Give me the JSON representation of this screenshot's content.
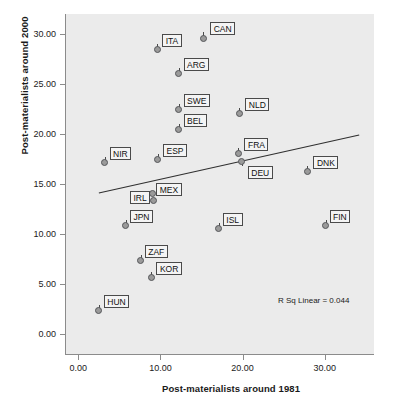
{
  "chart_data": {
    "type": "scatter",
    "title": "",
    "xlabel": "Post-materialists around 1981",
    "ylabel": "Post-materialists around 2000",
    "xlim": [
      -1.5,
      36.0
    ],
    "ylim": [
      -2.0,
      32.0
    ],
    "xticks": [
      "0.00",
      "10.00",
      "20.00",
      "30.00"
    ],
    "xtick_values": [
      0,
      10,
      20,
      30
    ],
    "yticks": [
      "0.00",
      "5.00",
      "10.00",
      "15.00",
      "20.00",
      "25.00",
      "30.00"
    ],
    "ytick_values": [
      0,
      5,
      10,
      15,
      20,
      25,
      30
    ],
    "grid": false,
    "legend": "none",
    "annotation": "R Sq Linear = 0.044",
    "fit_line": {
      "x_start": 2.5,
      "y_start": 14.1,
      "x_end": 34.2,
      "y_end": 19.9
    },
    "point_label_key": "label",
    "points": [
      {
        "label": "CAN",
        "x": 15.2,
        "y": 29.6,
        "lx": 7,
        "ly": -16
      },
      {
        "label": "ITA",
        "x": 9.6,
        "y": 28.5,
        "lx": 5,
        "ly": -15
      },
      {
        "label": "ARG",
        "x": 12.2,
        "y": 26.1,
        "lx": 5,
        "ly": -15
      },
      {
        "label": "SWE",
        "x": 12.2,
        "y": 22.5,
        "lx": 5,
        "ly": -15
      },
      {
        "label": "NLD",
        "x": 19.6,
        "y": 22.1,
        "lx": 6,
        "ly": -15
      },
      {
        "label": "BEL",
        "x": 12.2,
        "y": 20.5,
        "lx": 5,
        "ly": -15
      },
      {
        "label": "FRA",
        "x": 19.5,
        "y": 18.1,
        "lx": 6,
        "ly": -15
      },
      {
        "label": "ESP",
        "x": 9.7,
        "y": 17.5,
        "lx": 5,
        "ly": -15
      },
      {
        "label": "NIR",
        "x": 3.2,
        "y": 17.2,
        "lx": 5,
        "ly": -15
      },
      {
        "label": "DEU",
        "x": 19.9,
        "y": 17.3,
        "lx": 6,
        "ly": 5
      },
      {
        "label": "DNK",
        "x": 27.9,
        "y": 16.3,
        "lx": 6,
        "ly": -15
      },
      {
        "label": "MEX",
        "x": 9.0,
        "y": 14.1,
        "lx": 4,
        "ly": -10
      },
      {
        "label": "IRL",
        "x": 9.2,
        "y": 13.4,
        "lx": -24,
        "ly": -9
      },
      {
        "label": "JPN",
        "x": 5.8,
        "y": 10.9,
        "lx": 4,
        "ly": -15
      },
      {
        "label": "ISL",
        "x": 17.1,
        "y": 10.6,
        "lx": 4,
        "ly": -15
      },
      {
        "label": "FIN",
        "x": 30.1,
        "y": 10.9,
        "lx": 4,
        "ly": -15
      },
      {
        "label": "ZAF",
        "x": 7.6,
        "y": 7.4,
        "lx": 4,
        "ly": -15
      },
      {
        "label": "KOR",
        "x": 8.9,
        "y": 5.7,
        "lx": 5,
        "ly": -15
      },
      {
        "label": "HUN",
        "x": 2.5,
        "y": 2.4,
        "lx": 5,
        "ly": -15
      }
    ]
  }
}
